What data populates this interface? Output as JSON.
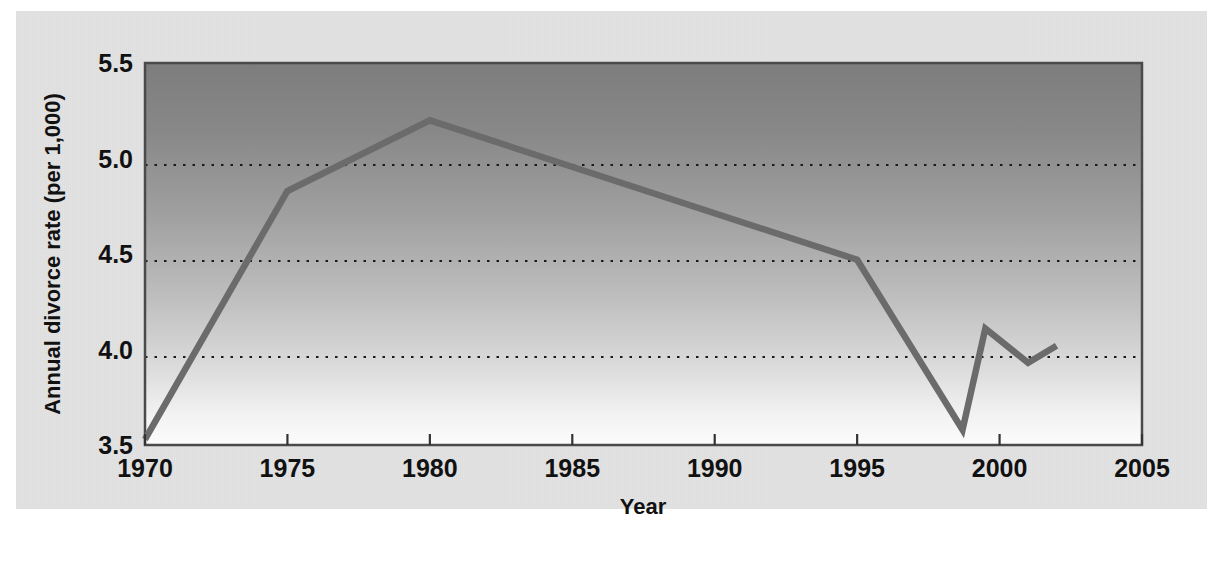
{
  "figure": {
    "background_color": "#e3e3e3",
    "page_color": "#ffffff",
    "plot_border_color": "#4a4a4a",
    "line_color": "#6b6b6b",
    "gridline_color": "#1a1a1a"
  },
  "chart_data": {
    "type": "line",
    "title": "",
    "subtitle": "",
    "xlabel": "Year",
    "ylabel": "Annual divorce rate (per 1,000)",
    "xlim": [
      1970,
      2005
    ],
    "ylim": [
      3.5,
      5.5
    ],
    "xticks": [
      1970,
      1975,
      1980,
      1985,
      1990,
      1995,
      2000,
      2005
    ],
    "xtick_labels": [
      "1970",
      "1975",
      "1980",
      "1985",
      "1990",
      "1995",
      "2000",
      "2005"
    ],
    "yticks": [
      3.5,
      4.0,
      4.5,
      5.0,
      5.5
    ],
    "ytick_labels": [
      "3.5",
      "4.0",
      "4.5",
      "5.0",
      "5.5"
    ],
    "grid": "horizontal-dotted",
    "gridline_values": [
      4.0,
      4.5,
      5.0
    ],
    "legend": null,
    "legend_position": "none",
    "annotations": [],
    "series": [
      {
        "name": "Annual divorce rate (per 1,000)",
        "x": [
          1970,
          1975,
          1980,
          1995,
          1998.7,
          1999.5,
          2001,
          2002
        ],
        "values": [
          3.53,
          4.83,
          5.2,
          4.47,
          3.58,
          4.11,
          3.93,
          4.02
        ]
      }
    ]
  },
  "axis": {
    "x_title": "Year",
    "y_title": "Annual divorce rate (per 1,000)"
  }
}
